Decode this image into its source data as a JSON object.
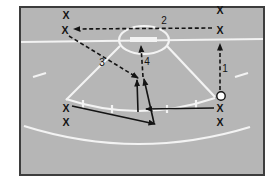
{
  "diagram": {
    "canvas": {
      "width": 279,
      "height": 194
    },
    "colors": {
      "page": "#ffffff",
      "field": "#b6b6b6",
      "line": "#f3f3f3",
      "ink": "#141414",
      "frame": "#3d3d3d",
      "ball_fill": "#ffffff"
    },
    "frame": {
      "x": 20,
      "y": 7,
      "w": 244,
      "h": 168
    },
    "field_lines": [
      {
        "name": "goal-line",
        "type": "line",
        "x1": 21,
        "y1": 42,
        "x2": 263,
        "y2": 39
      },
      {
        "name": "penalty-side-left",
        "type": "line",
        "x1": 120,
        "y1": 46,
        "x2": 66,
        "y2": 100
      },
      {
        "name": "penalty-side-right",
        "type": "line",
        "x1": 167,
        "y1": 46,
        "x2": 215,
        "y2": 97
      },
      {
        "name": "penalty-front-arc",
        "type": "path",
        "d": "M66,99 Q140,123.5 215,98"
      },
      {
        "name": "outer-arc",
        "type": "path",
        "d": "M24,126 Q137,161.5 250,127"
      },
      {
        "name": "goal-crease-ellipse",
        "type": "ellipse",
        "cx": 144,
        "cy": 40,
        "rx": 25,
        "ry": 14
      },
      {
        "name": "goal-bar",
        "type": "rect",
        "x": 130,
        "y": 37,
        "w": 27,
        "h": 5
      },
      {
        "name": "hash-left",
        "type": "line",
        "x1": 33,
        "y1": 77,
        "x2": 46,
        "y2": 73
      },
      {
        "name": "hash-right",
        "type": "line",
        "x1": 235,
        "y1": 77,
        "x2": 248,
        "y2": 73
      },
      {
        "name": "arc-tick-1",
        "type": "line",
        "x1": 83,
        "y1": 100,
        "x2": 83,
        "y2": 108
      },
      {
        "name": "arc-tick-2",
        "type": "line",
        "x1": 112,
        "y1": 105,
        "x2": 112,
        "y2": 113
      },
      {
        "name": "arc-tick-3",
        "type": "line",
        "x1": 167,
        "y1": 105,
        "x2": 167,
        "y2": 113
      },
      {
        "name": "arc-tick-4",
        "type": "line",
        "x1": 196,
        "y1": 100,
        "x2": 196,
        "y2": 108
      }
    ],
    "players": [
      {
        "name": "player-top-left-1",
        "label": "X",
        "x": 66,
        "y": 15
      },
      {
        "name": "player-top-left-2",
        "label": "X",
        "x": 65,
        "y": 30
      },
      {
        "name": "player-top-right-1",
        "label": "X",
        "x": 220,
        "y": 10
      },
      {
        "name": "player-top-right-2",
        "label": "X",
        "x": 220,
        "y": 30
      },
      {
        "name": "player-bottom-left-1",
        "label": "X",
        "x": 66,
        "y": 108
      },
      {
        "name": "player-bottom-left-2",
        "label": "X",
        "x": 66,
        "y": 122
      },
      {
        "name": "player-bottom-right-1",
        "label": "X",
        "x": 220,
        "y": 108
      },
      {
        "name": "player-bottom-right-2",
        "label": "X",
        "x": 220,
        "y": 122
      }
    ],
    "ball": {
      "name": "ball-marker",
      "cx": 221,
      "cy": 96,
      "r": 4.2
    },
    "movements": [
      {
        "num": "1",
        "style": "dashed",
        "x1": 220,
        "y1": 90,
        "x2": 220,
        "y2": 44,
        "lx": 225,
        "ly": 68
      },
      {
        "num": "2",
        "style": "dashed",
        "x1": 212,
        "y1": 28,
        "x2": 74,
        "y2": 29,
        "lx": 164,
        "ly": 20
      },
      {
        "num": "3",
        "style": "dashed",
        "x1": 69,
        "y1": 36,
        "x2": 138,
        "y2": 78,
        "lx": 102,
        "ly": 62
      },
      {
        "num": "4",
        "style": "dashed",
        "x1": 143,
        "y1": 77,
        "x2": 141,
        "y2": 46,
        "lx": 147,
        "ly": 61
      },
      {
        "num": "",
        "style": "solid",
        "x1": 138,
        "y1": 112,
        "x2": 137,
        "y2": 80
      },
      {
        "num": "",
        "style": "solid",
        "x1": 154,
        "y1": 123,
        "x2": 144,
        "y2": 79
      },
      {
        "num": "",
        "style": "solid",
        "x1": 214,
        "y1": 108,
        "x2": 146,
        "y2": 109
      },
      {
        "num": "",
        "style": "solid",
        "x1": 72,
        "y1": 106,
        "x2": 155,
        "y2": 124
      }
    ]
  }
}
